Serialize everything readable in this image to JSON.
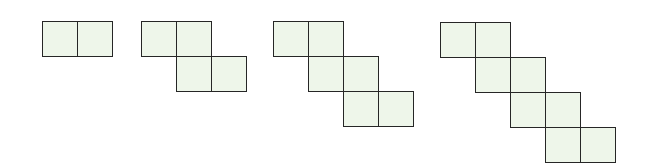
{
  "diagram": {
    "type": "pattern-sequence",
    "colors": {
      "fill": "#eef6ea",
      "stroke": "#262626",
      "background": "#ffffff"
    },
    "cell_size": 35,
    "figures": [
      {
        "index": 1,
        "origin": [
          42,
          21
        ],
        "cells": [
          [
            0,
            0
          ],
          [
            1,
            0
          ]
        ],
        "square_count": 2
      },
      {
        "index": 2,
        "origin": [
          141,
          21
        ],
        "cells": [
          [
            0,
            0
          ],
          [
            1,
            0
          ],
          [
            1,
            1
          ],
          [
            2,
            1
          ]
        ],
        "square_count": 4
      },
      {
        "index": 3,
        "origin": [
          273,
          21
        ],
        "cells": [
          [
            0,
            0
          ],
          [
            1,
            0
          ],
          [
            1,
            1
          ],
          [
            2,
            1
          ],
          [
            2,
            2
          ],
          [
            3,
            2
          ]
        ],
        "square_count": 6
      },
      {
        "index": 4,
        "origin": [
          440,
          22
        ],
        "cells": [
          [
            0,
            0
          ],
          [
            1,
            0
          ],
          [
            1,
            1
          ],
          [
            2,
            1
          ],
          [
            2,
            2
          ],
          [
            3,
            2
          ],
          [
            3,
            3
          ],
          [
            4,
            3
          ]
        ],
        "square_count": 8
      }
    ]
  }
}
